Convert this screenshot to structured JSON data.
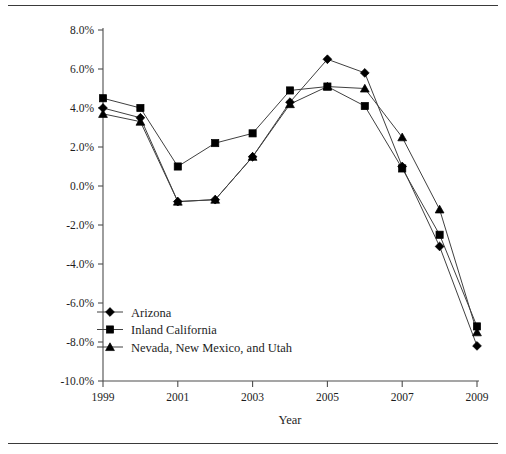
{
  "chart_data": {
    "type": "line",
    "title": "",
    "xlabel": "Year",
    "ylabel": "",
    "x": [
      1999,
      2000,
      2001,
      2002,
      2003,
      2004,
      2005,
      2006,
      2007,
      2008,
      2009
    ],
    "xlim": [
      1999,
      2009
    ],
    "ylim": [
      -10.0,
      8.0
    ],
    "xticks": [
      1999,
      2001,
      2003,
      2005,
      2007,
      2009
    ],
    "xtick_labels": [
      "1999",
      "2001",
      "2003",
      "2005",
      "2007",
      "2009"
    ],
    "yticks": [
      8.0,
      6.0,
      4.0,
      2.0,
      0.0,
      -2.0,
      -4.0,
      -6.0,
      -8.0,
      -10.0
    ],
    "ytick_labels": [
      "8.0%",
      "6.0%",
      "4.0%",
      "2.0%",
      "0.0%",
      "-2.0%",
      "-4.0%",
      "-6.0%",
      "-8.0%",
      "-10.0%"
    ],
    "grid": false,
    "legend_position": "lower-left-inside",
    "series": [
      {
        "name": "Arizona",
        "marker": "diamond",
        "color": "#000000",
        "values": [
          4.0,
          3.5,
          -0.8,
          -0.7,
          1.5,
          4.3,
          6.5,
          5.8,
          1.0,
          -3.1,
          -8.2
        ]
      },
      {
        "name": "Inland California",
        "marker": "square",
        "color": "#000000",
        "values": [
          4.5,
          4.0,
          1.0,
          2.2,
          2.7,
          4.9,
          5.1,
          4.1,
          0.9,
          -2.5,
          -7.2
        ]
      },
      {
        "name": "Nevada, New Mexico, and Utah",
        "marker": "triangle",
        "color": "#000000",
        "values": [
          3.7,
          3.3,
          -0.8,
          -0.7,
          1.5,
          4.2,
          5.1,
          5.0,
          2.5,
          -1.2,
          -7.5
        ]
      }
    ]
  },
  "figure": {
    "axis_title_x": "Year"
  }
}
